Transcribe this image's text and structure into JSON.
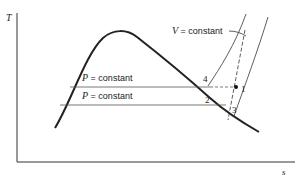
{
  "diagram": {
    "type": "temperature-entropy (T-s) diagram",
    "axes": {
      "y_label": "T",
      "x_label": "s"
    },
    "labels": {
      "pressure_upper": {
        "var": "P",
        "eq": " = constant"
      },
      "pressure_lower": {
        "var": "P",
        "eq": " = constant"
      },
      "volume": {
        "var": "V",
        "eq": " = constant"
      }
    },
    "points": [
      {
        "id": "1",
        "label": "1"
      },
      {
        "id": "2",
        "label": "2"
      },
      {
        "id": "3",
        "label": "3"
      },
      {
        "id": "4",
        "label": "4"
      }
    ],
    "colors": {
      "line": "#222222",
      "background": "#ffffff"
    }
  }
}
